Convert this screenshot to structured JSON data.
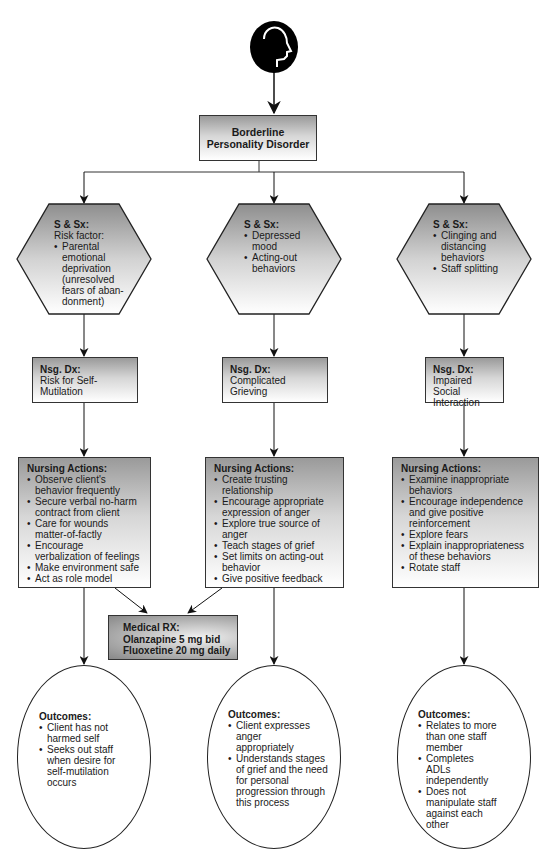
{
  "diagram": {
    "root": {
      "icon": "head-profile-icon",
      "title_line1": "Borderline",
      "title_line2": "Personality Disorder"
    },
    "columns": [
      {
        "signs_symptoms": {
          "label": "S & Sx:",
          "intro": "Risk factor:",
          "items": [
            "Parental emotional deprivation (unresolved fears of aban-donment)"
          ]
        },
        "nursing_diagnosis": {
          "label": "Nsg. Dx:",
          "text": "Risk for Self-Mutilation"
        },
        "nursing_actions": {
          "label": "Nursing Actions:",
          "items": [
            "Observe client's behavior frequently",
            "Secure verbal no-harm contract from client",
            "Care for wounds matter-of-factly",
            "Encourage verbalization of feelings",
            "Make environment safe",
            "Act as role model"
          ]
        },
        "outcomes": {
          "label": "Outcomes:",
          "items": [
            "Client has not harmed self",
            "Seeks out staff when desire for self-mutilation occurs"
          ]
        }
      },
      {
        "signs_symptoms": {
          "label": "S & Sx:",
          "intro": "",
          "items": [
            "Depressed mood",
            "Acting-out behaviors"
          ]
        },
        "nursing_diagnosis": {
          "label": "Nsg. Dx:",
          "text": "Complicated Grieving"
        },
        "nursing_actions": {
          "label": "Nursing Actions:",
          "items": [
            "Create trusting relationship",
            "Encourage appropriate expression of anger",
            "Explore true source of anger",
            "Teach stages of grief",
            "Set limits on acting-out behavior",
            "Give positive feedback"
          ]
        },
        "outcomes": {
          "label": "Outcomes:",
          "items": [
            "Client expresses anger appropriately",
            "Understands stages of grief and the need for personal progression through this process"
          ]
        }
      },
      {
        "signs_symptoms": {
          "label": "S & Sx:",
          "intro": "",
          "items": [
            "Clinging and distancing behaviors",
            "Staff splitting"
          ]
        },
        "nursing_diagnosis": {
          "label": "Nsg. Dx:",
          "text": "Impaired Social Interaction"
        },
        "nursing_actions": {
          "label": "Nursing Actions:",
          "items": [
            "Examine inappropriate behaviors",
            "Encourage independence and give positive reinforcement",
            "Explore fears",
            "Explain inappropriateness of these behaviors",
            "Rotate staff"
          ]
        },
        "outcomes": {
          "label": "Outcomes:",
          "items": [
            "Relates to more than one staff member",
            "Completes ADLs independently",
            "Does not manipulate staff against each other"
          ]
        }
      }
    ],
    "medical_rx": {
      "label": "Medical RX:",
      "items": [
        "Olanzapine 5 mg bid",
        "Fluoxetine 20 mg daily"
      ]
    }
  }
}
